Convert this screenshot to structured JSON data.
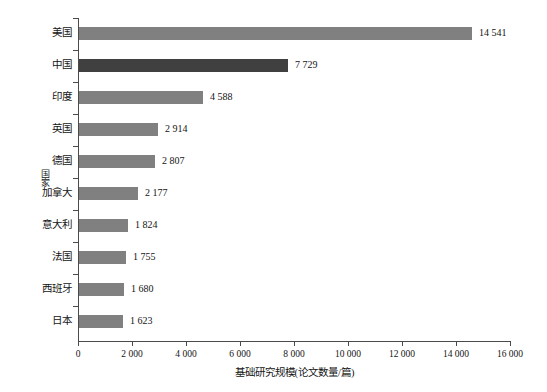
{
  "chart_data": {
    "type": "bar",
    "orientation": "horizontal",
    "title": "",
    "xlabel": "基础研究规模(论文数量/篇)",
    "ylabel": "国家",
    "categories": [
      "美国",
      "中国",
      "印度",
      "英国",
      "德国",
      "加拿大",
      "意大利",
      "法国",
      "西班牙",
      "日本"
    ],
    "values": [
      14541,
      7729,
      4588,
      2914,
      2807,
      2177,
      1824,
      1755,
      1680,
      1623
    ],
    "value_labels": [
      "14 541",
      "7 729",
      "4 588",
      "2 914",
      "2 807",
      "2 177",
      "1 824",
      "1 755",
      "1 680",
      "1 623"
    ],
    "xlim": [
      0,
      16000
    ],
    "xticks": [
      0,
      2000,
      4000,
      6000,
      8000,
      10000,
      12000,
      14000,
      16000
    ],
    "xtick_labels": [
      "0",
      "2 000",
      "4 000",
      "6 000",
      "8 000",
      "10 000",
      "12 000",
      "14 000",
      "16 000"
    ],
    "grid": false,
    "legend": "none",
    "bar_color": "#808080",
    "highlight_color": "#404040",
    "highlight_category": "中国",
    "axis_color": "#4a4a4a"
  }
}
